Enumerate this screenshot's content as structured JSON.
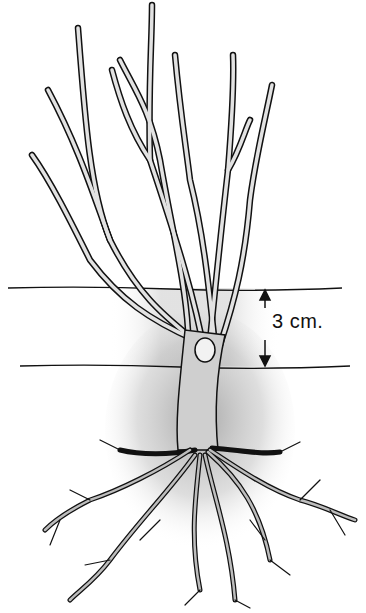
{
  "illustration": {
    "subject": "bare-root rose bush planting depth",
    "measurement": {
      "label": "3 cm.",
      "arrow_top_y": 290,
      "arrow_bottom_y": 366
    },
    "lines": {
      "upper_line": {
        "x1": 8,
        "x2": 342,
        "y": 288
      },
      "lower_line": {
        "x1": 20,
        "x2": 350,
        "y": 366
      }
    },
    "colors": {
      "ink": "#111111",
      "stem_fill": "#d9d9d9",
      "soil_shade": "#9a9a9a",
      "background": "#ffffff"
    }
  }
}
